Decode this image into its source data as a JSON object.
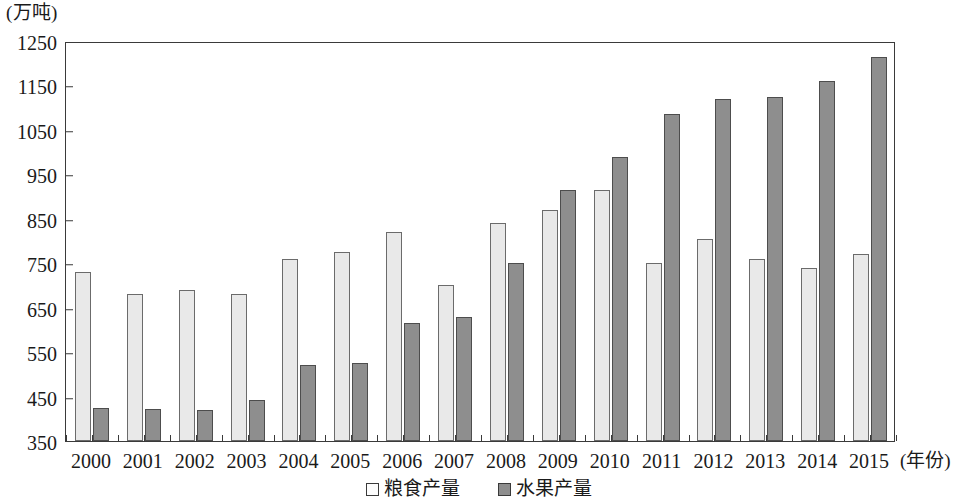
{
  "chart_data": {
    "type": "bar",
    "title": "",
    "xlabel": "(年份)",
    "ylabel": "(万吨)",
    "categories": [
      "2000",
      "2001",
      "2002",
      "2003",
      "2004",
      "2005",
      "2006",
      "2007",
      "2008",
      "2009",
      "2010",
      "2011",
      "2012",
      "2013",
      "2014",
      "2015"
    ],
    "series": [
      {
        "name": "粮食产量",
        "color": "#e9e9e9",
        "values": [
          730,
          680,
          690,
          680,
          760,
          775,
          820,
          700,
          840,
          870,
          915,
          750,
          805,
          760,
          740,
          770
        ]
      },
      {
        "name": "水果产量",
        "color": "#8e8e8e",
        "values": [
          425,
          422,
          420,
          443,
          520,
          525,
          615,
          630,
          750,
          915,
          990,
          1085,
          1120,
          1125,
          1160,
          1215
        ]
      }
    ],
    "ylim": [
      350,
      1250
    ],
    "ytick_step": 100,
    "yticks": [
      350,
      450,
      550,
      650,
      750,
      850,
      950,
      1050,
      1150,
      1250
    ],
    "ytick_labels": [
      "350",
      "450",
      "550",
      "650",
      "750",
      "850",
      "950",
      "1050",
      "1150",
      "1250"
    ],
    "grid": false,
    "legend_position": "bottom-center"
  },
  "legend": {
    "entries": [
      {
        "label": "粮食产量"
      },
      {
        "label": "水果产量"
      }
    ]
  }
}
